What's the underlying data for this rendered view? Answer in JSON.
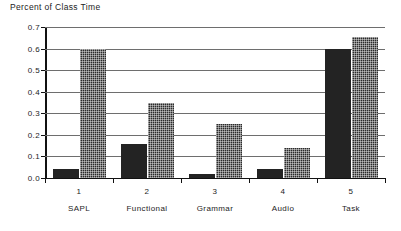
{
  "chart_data": {
    "type": "bar",
    "title": "Percent of Class Time",
    "xlabel": "",
    "ylabel": "",
    "ylim": [
      0.0,
      0.7
    ],
    "yticks": [
      "0.0",
      "0.1",
      "0.2",
      "0.3",
      "0.4",
      "0.5",
      "0.6",
      "0.7"
    ],
    "ytick_values": [
      0.0,
      0.1,
      0.2,
      0.3,
      0.4,
      0.5,
      0.6,
      0.7
    ],
    "grid": true,
    "legend": "none",
    "categories": [
      "SAPL",
      "Functional",
      "Grammar",
      "Audio",
      "Task"
    ],
    "category_numbers": [
      "1",
      "2",
      "3",
      "4",
      "5"
    ],
    "series": [
      {
        "name": "series-1-solid",
        "fill": "solid",
        "color": "#232323",
        "values": [
          0.04,
          0.16,
          0.02,
          0.04,
          0.6
        ]
      },
      {
        "name": "series-2-dotted",
        "fill": "dotted",
        "color": "#2b2b2b",
        "values": [
          0.6,
          0.35,
          0.25,
          0.14,
          0.655
        ]
      }
    ]
  }
}
